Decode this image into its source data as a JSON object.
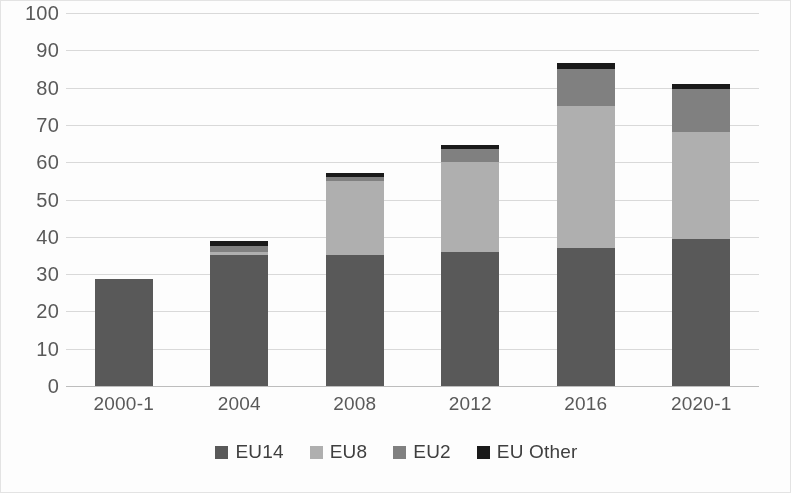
{
  "chart_data": {
    "type": "bar",
    "stacked": true,
    "title": "",
    "subtitle": "",
    "xlabel": "",
    "ylabel": "",
    "categories": [
      "2000-1",
      "2004",
      "2008",
      "2012",
      "2016",
      "2020-1"
    ],
    "series": [
      {
        "name": "EU14",
        "color": "#595959",
        "values": [
          28.8,
          35.0,
          35.0,
          36.0,
          37.0,
          39.5
        ]
      },
      {
        "name": "EU8",
        "color": "#afafaf",
        "values": [
          0.0,
          1.0,
          20.0,
          24.0,
          38.0,
          28.5
        ]
      },
      {
        "name": "EU2",
        "color": "#808080",
        "values": [
          0.0,
          1.5,
          1.0,
          3.5,
          10.0,
          11.5
        ]
      },
      {
        "name": "EU Other",
        "color": "#1a1a1a",
        "values": [
          0.0,
          1.5,
          1.0,
          1.0,
          1.5,
          1.5
        ]
      }
    ],
    "totals": [
      28.8,
      39.0,
      57.0,
      64.5,
      86.5,
      81.0
    ],
    "ylim": [
      0,
      100
    ],
    "ytick_step": 10,
    "yticks": [
      100,
      90,
      80,
      70,
      60,
      50,
      40,
      30,
      20,
      10,
      0
    ],
    "grid": true,
    "legend_position": "bottom",
    "legend": [
      "EU14",
      "EU8",
      "EU2",
      "EU Other"
    ]
  },
  "axis": {
    "y_ticks": [
      "100",
      "90",
      "80",
      "70",
      "60",
      "50",
      "40",
      "30",
      "20",
      "10",
      "0"
    ],
    "x_ticks": [
      "2000-1",
      "2004",
      "2008",
      "2012",
      "2016",
      "2020-1"
    ]
  },
  "legend": {
    "items": [
      {
        "label": "EU14",
        "color": "#595959"
      },
      {
        "label": "EU8",
        "color": "#afafaf"
      },
      {
        "label": "EU2",
        "color": "#808080"
      },
      {
        "label": "EU Other",
        "color": "#1a1a1a"
      }
    ]
  },
  "colors": {
    "gridline": "#d9d9d9",
    "axis_text": "#595959",
    "legend_text": "#3f3f3f",
    "background": "#fdfdfd",
    "frame": "#e3e3e3"
  }
}
